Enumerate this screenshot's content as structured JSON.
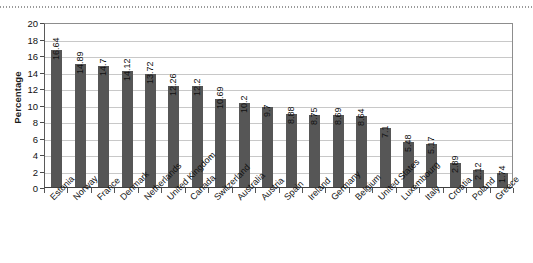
{
  "chart_data": {
    "type": "bar",
    "title": "",
    "subtitle": "",
    "xlabel": "",
    "ylabel": "Percentage",
    "ylim": [
      0,
      20
    ],
    "ytick_step": 2,
    "yticks": [
      0,
      2,
      4,
      6,
      8,
      10,
      12,
      14,
      16,
      18,
      20
    ],
    "grid": "horizontal",
    "legend": "none",
    "bar_color": "#565656",
    "gridline_color": "#c8c8c8",
    "plot_background": "#ffffff",
    "categories": [
      "Estonia",
      "Norway",
      "France",
      "Denmark",
      "Netherlands",
      "United Kingdom",
      "Canada",
      "Switzerland",
      "Australia",
      "Austria",
      "Spain",
      "Ireland",
      "Germany",
      "Belgium",
      "United States",
      "Luxembourg",
      "Italy",
      "Croatia",
      "Poland",
      "Greece"
    ],
    "values": [
      16.64,
      14.89,
      14.7,
      14.12,
      13.72,
      12.26,
      12.2,
      10.69,
      10.2,
      9.7,
      8.88,
      8.75,
      8.69,
      8.64,
      7.1,
      5.48,
      5.17,
      2.89,
      2.12,
      1.74
    ],
    "value_labels": [
      "16.64",
      "14.89",
      "14.7",
      "14.12",
      "13.72",
      "12.26",
      "12.2",
      "10.69",
      "10.2",
      "9.7",
      "8.88",
      "8.75",
      "8.69",
      "8.64",
      "7.1",
      "5.48",
      "5.17",
      "2.89",
      "2.12",
      "1.74"
    ]
  }
}
